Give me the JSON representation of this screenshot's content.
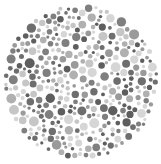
{
  "image": {
    "kind": "color-vision-test-plate",
    "description": "Circular field of dots in varied shades of gray (Ishihara-style plate)",
    "background_color": "#ffffff",
    "circle": {
      "cx": 80.5,
      "cy": 82,
      "r": 78
    },
    "dot_palette": [
      "#5e5e5e",
      "#6e6e6e",
      "#7f7f7f",
      "#9a9a9a",
      "#b0b0b0",
      "#c6c6c6",
      "#d6d6d6"
    ],
    "dot_count_approx": 420,
    "seed": 7
  }
}
